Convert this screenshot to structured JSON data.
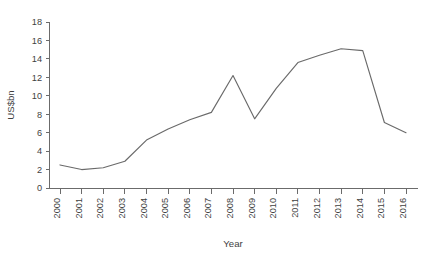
{
  "chart_data": {
    "type": "line",
    "title": "",
    "subtitle": "",
    "xlabel": "Year",
    "ylabel": "US$bn",
    "x": [
      2000,
      2001,
      2002,
      2003,
      2004,
      2005,
      2006,
      2007,
      2008,
      2009,
      2010,
      2011,
      2012,
      2013,
      2014,
      2015,
      2016
    ],
    "categories": [
      "2000",
      "2001",
      "2002",
      "2003",
      "2004",
      "2005",
      "2006",
      "2007",
      "2008",
      "2009",
      "2010",
      "2011",
      "2012",
      "2013",
      "2014",
      "2015",
      "2016"
    ],
    "values": [
      2.5,
      2.0,
      2.2,
      2.9,
      5.2,
      6.4,
      7.4,
      8.2,
      12.2,
      7.5,
      10.8,
      13.6,
      14.4,
      15.1,
      14.9,
      7.1,
      6.0
    ],
    "series": [
      {
        "name": "US$bn",
        "values": [
          2.5,
          2.0,
          2.2,
          2.9,
          5.2,
          6.4,
          7.4,
          8.2,
          12.2,
          7.5,
          10.8,
          13.6,
          14.4,
          15.1,
          14.9,
          7.1,
          6.0
        ]
      }
    ],
    "xtick_labels": [
      "2000",
      "2001",
      "2002",
      "2003",
      "2004",
      "2005",
      "2006",
      "2007",
      "2008",
      "2009",
      "2010",
      "2011",
      "2012",
      "2013",
      "2014",
      "2015",
      "2016"
    ],
    "ytick_labels": [
      "0",
      "2",
      "4",
      "6",
      "8",
      "10",
      "12",
      "14",
      "16",
      "18"
    ],
    "yticks": [
      0,
      2,
      4,
      6,
      8,
      10,
      12,
      14,
      16,
      18
    ],
    "ylim": [
      0,
      18
    ],
    "xlim": [
      2000,
      2016
    ],
    "grid": false,
    "legend": false,
    "legend_position": "none",
    "xtick_label_rotation": -90,
    "line_color": "#6a6a6a",
    "axis_color": "#6b6b6b",
    "text_color": "#3f3f3f",
    "background_color": "#ffffff",
    "annotations": []
  }
}
